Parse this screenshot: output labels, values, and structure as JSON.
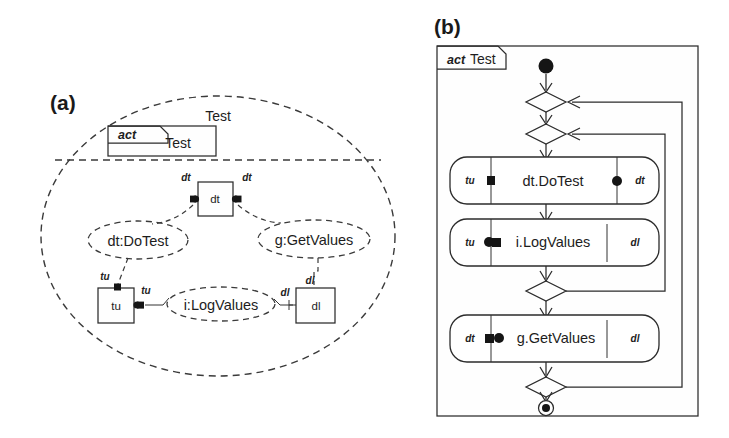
{
  "figure": {
    "panel_a_label": "(a)",
    "panel_b_label": "(b)"
  },
  "panel_a": {
    "name": "Test",
    "activity_box": {
      "keyword": "act",
      "label": "Test"
    },
    "components": [
      {
        "id": "dt",
        "label": "dt",
        "ports": [
          "dt",
          "dt"
        ]
      },
      {
        "id": "tu",
        "label": "tu",
        "ports": [
          "tu",
          "tu"
        ]
      },
      {
        "id": "dl",
        "label": "dl",
        "ports": [
          "dl",
          "dl"
        ]
      }
    ],
    "use_cases": [
      {
        "id": "dotest",
        "label": "dt:DoTest"
      },
      {
        "id": "getvalues",
        "label": "g:GetValues"
      },
      {
        "id": "logvalues",
        "label": "i:LogValues"
      }
    ],
    "port_labels": {
      "dt_left": "dt",
      "dt_right": "dt",
      "tu_top": "tu",
      "tu_right": "tu",
      "dl_top": "dl",
      "dl_left": "dl"
    }
  },
  "panel_b": {
    "frame_keyword": "act",
    "frame_title": "Test",
    "nodes": [
      {
        "id": "initial",
        "type": "initial-node",
        "label": ""
      },
      {
        "id": "merge1",
        "type": "merge-node",
        "label": ""
      },
      {
        "id": "merge2",
        "type": "merge-node",
        "label": ""
      },
      {
        "id": "dotest",
        "type": "action",
        "label": "dt.DoTest",
        "left_pin": "tu",
        "right_pin": "dt",
        "left_marker": "square",
        "right_marker": "circle"
      },
      {
        "id": "logvalues",
        "type": "action",
        "label": "i.LogValues",
        "left_pin": "tu",
        "right_pin": "dl",
        "left_marker": "circle-square",
        "right_marker": "none"
      },
      {
        "id": "decision1",
        "type": "decision-node",
        "label": ""
      },
      {
        "id": "getvalues",
        "type": "action",
        "label": "g.GetValues",
        "left_pin": "dt",
        "right_pin": "dl",
        "left_marker": "square-circle",
        "right_marker": "none"
      },
      {
        "id": "decision2",
        "type": "decision-node",
        "label": ""
      },
      {
        "id": "final",
        "type": "final-node",
        "label": ""
      }
    ]
  },
  "colors": {
    "ink": "#2b2b2b",
    "paper": "#ffffff"
  }
}
